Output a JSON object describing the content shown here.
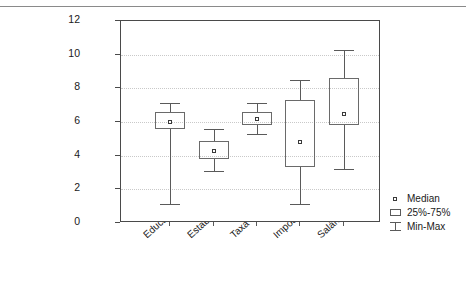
{
  "chart_data": {
    "type": "box",
    "title": "",
    "xlabel": "",
    "ylabel": "",
    "ylim": [
      0,
      12
    ],
    "yticks": [
      0,
      2,
      4,
      6,
      8,
      10,
      12
    ],
    "grid": true,
    "legend_position": "right",
    "categories": [
      "Educação",
      "Estabilidade",
      "Taxa de Juros",
      "Impostos",
      "Salários"
    ],
    "boxes": [
      {
        "category": "Educação",
        "min": 1.1,
        "q1": 5.6,
        "median": 6.0,
        "q3": 6.6,
        "max": 7.1
      },
      {
        "category": "Estabilidade",
        "min": 3.1,
        "q1": 3.8,
        "median": 4.3,
        "q3": 4.9,
        "max": 5.6
      },
      {
        "category": "Taxa de Juros",
        "min": 5.3,
        "q1": 5.8,
        "median": 6.2,
        "q3": 6.6,
        "max": 7.1
      },
      {
        "category": "Impostos",
        "min": 1.1,
        "q1": 3.3,
        "median": 4.8,
        "q3": 7.3,
        "max": 8.5
      },
      {
        "category": "Salários",
        "min": 3.2,
        "q1": 5.8,
        "median": 6.5,
        "q3": 8.6,
        "max": 10.3
      }
    ],
    "legend": [
      {
        "key": "median-marker",
        "label": "Median"
      },
      {
        "key": "quartile-box",
        "label": "25%-75%"
      },
      {
        "key": "minmax-whisker",
        "label": "Min-Max"
      }
    ],
    "colors": {
      "box_stroke": "#6a6a6a",
      "whisker_stroke": "#5a5a5a",
      "median_stroke": "#3a3a3a",
      "frame": "#4a4a4a",
      "grid": "#c9c9c9",
      "background": "#ffffff",
      "text": "#1a1a1a"
    }
  }
}
